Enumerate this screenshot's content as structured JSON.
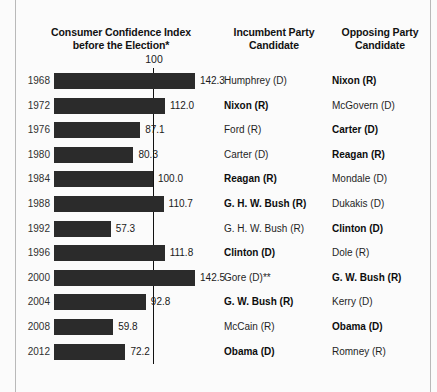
{
  "headers": {
    "cci": "Consumer Confidence Index\nbefore the Election*",
    "cci_line1": "Consumer Confidence Index",
    "cci_line2": "before the Election*",
    "incumbent_line1": "Incumbent Party",
    "incumbent_line2": "Candidate",
    "opposing_line1": "Opposing Party",
    "opposing_line2": "Candidate"
  },
  "reference": {
    "label": "100",
    "value": 100
  },
  "colors": {
    "bar": "#2b2b2b",
    "reference_line": "#111111",
    "background": "#fbfbfb",
    "frame": "#b9b9b9"
  },
  "chart_data": {
    "type": "bar",
    "title": "Consumer Confidence Index before the Election*",
    "xlabel": "",
    "ylabel": "",
    "orientation": "horizontal",
    "xlim": [
      0,
      150
    ],
    "grid": false,
    "reference_line": 100,
    "reference_line_label": "100",
    "categories": [
      "1968",
      "1972",
      "1976",
      "1980",
      "1984",
      "1988",
      "1992",
      "1996",
      "2000",
      "2004",
      "2008",
      "2012"
    ],
    "values": [
      142.3,
      112.0,
      87.1,
      80.3,
      100.0,
      110.7,
      57.3,
      111.8,
      142.5,
      92.8,
      59.8,
      72.2
    ],
    "value_labels": [
      "142.3",
      "112.0",
      "87.1",
      "80.3",
      "100.0",
      "110.7",
      "57.3",
      "111.8",
      "142.5",
      "92.8",
      "59.8",
      "72.2"
    ],
    "series": [
      {
        "name": "Consumer Confidence Index before the Election",
        "values": [
          142.3,
          112.0,
          87.1,
          80.3,
          100.0,
          110.7,
          57.3,
          111.8,
          142.5,
          92.8,
          59.8,
          72.2
        ]
      }
    ]
  },
  "rows": [
    {
      "year": "1968",
      "value": 142.3,
      "value_label": "142.3",
      "incumbent": "Humphrey (D)",
      "incumbent_winner": false,
      "opposing": "Nixon (R)",
      "opposing_winner": true
    },
    {
      "year": "1972",
      "value": 112.0,
      "value_label": "112.0",
      "incumbent": "Nixon (R)",
      "incumbent_winner": true,
      "opposing": "McGovern (D)",
      "opposing_winner": false
    },
    {
      "year": "1976",
      "value": 87.1,
      "value_label": "87.1",
      "incumbent": "Ford (R)",
      "incumbent_winner": false,
      "opposing": "Carter (D)",
      "opposing_winner": true
    },
    {
      "year": "1980",
      "value": 80.3,
      "value_label": "80.3",
      "incumbent": "Carter (D)",
      "incumbent_winner": false,
      "opposing": "Reagan (R)",
      "opposing_winner": true
    },
    {
      "year": "1984",
      "value": 100.0,
      "value_label": "100.0",
      "incumbent": "Reagan (R)",
      "incumbent_winner": true,
      "opposing": "Mondale (D)",
      "opposing_winner": false
    },
    {
      "year": "1988",
      "value": 110.7,
      "value_label": "110.7",
      "incumbent": "G. H. W. Bush (R)",
      "incumbent_winner": true,
      "opposing": "Dukakis (D)",
      "opposing_winner": false
    },
    {
      "year": "1992",
      "value": 57.3,
      "value_label": "57.3",
      "incumbent": "G. H. W. Bush (R)",
      "incumbent_winner": false,
      "opposing": "Clinton (D)",
      "opposing_winner": true
    },
    {
      "year": "1996",
      "value": 111.8,
      "value_label": "111.8",
      "incumbent": "Clinton (D)",
      "incumbent_winner": true,
      "opposing": "Dole (R)",
      "opposing_winner": false
    },
    {
      "year": "2000",
      "value": 142.5,
      "value_label": "142.5",
      "incumbent": "Gore (D)**",
      "incumbent_winner": false,
      "opposing": "G. W. Bush (R)",
      "opposing_winner": true
    },
    {
      "year": "2004",
      "value": 92.8,
      "value_label": "92.8",
      "incumbent": "G. W. Bush (R)",
      "incumbent_winner": true,
      "opposing": "Kerry (D)",
      "opposing_winner": false
    },
    {
      "year": "2008",
      "value": 59.8,
      "value_label": "59.8",
      "incumbent": "McCain (R)",
      "incumbent_winner": false,
      "opposing": "Obama (D)",
      "opposing_winner": true
    },
    {
      "year": "2012",
      "value": 72.2,
      "value_label": "72.2",
      "incumbent": "Obama (D)",
      "incumbent_winner": true,
      "opposing": "Romney (R)",
      "opposing_winner": false
    }
  ]
}
